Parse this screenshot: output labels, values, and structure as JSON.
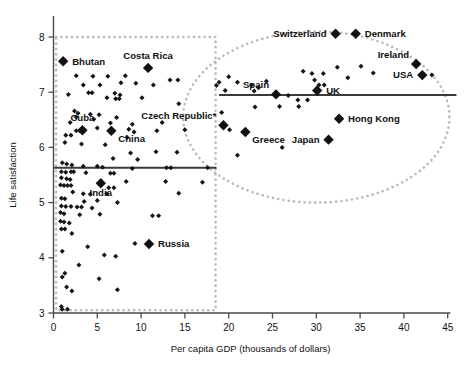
{
  "chart_data": {
    "type": "scatter",
    "title": "",
    "xlabel": "Per capita GDP (thousands of dollars)",
    "ylabel": "Life satisfaction",
    "xlim": [
      0,
      45
    ],
    "ylim": [
      3,
      8.2
    ],
    "xticks": [
      0,
      5,
      10,
      15,
      20,
      25,
      30,
      35,
      40,
      45
    ],
    "yticks": [
      3,
      4,
      5,
      6,
      7,
      8
    ],
    "grid": false,
    "legend": "none",
    "annotations": [
      {
        "text": "Czech Republic*",
        "note": "asterisk footnote marker on label"
      }
    ],
    "regions": [
      {
        "name": "poorer-countries-box",
        "shape": "rectangle",
        "style": "dotted",
        "x_range": [
          0.3,
          18.5
        ],
        "y_range": [
          3.05,
          8.0
        ]
      },
      {
        "name": "richer-countries-ellipse",
        "shape": "ellipse",
        "style": "dotted",
        "x_center": 30.0,
        "y_center": 6.55,
        "x_radius": 15.2,
        "y_radius": 1.55
      }
    ],
    "trend_lines": [
      {
        "name": "poorer-countries-trend",
        "y": 5.63,
        "x_start": 0.0,
        "x_end": 18.6
      },
      {
        "name": "richer-countries-trend",
        "y": 6.95,
        "x_start": 18.9,
        "x_end": 46.0
      }
    ],
    "labeled_points": [
      {
        "label": "Bhutan",
        "x": 1.1,
        "y": 7.56,
        "label_side": "right"
      },
      {
        "label": "Costa Rica",
        "x": 10.8,
        "y": 7.44,
        "label_side": "above"
      },
      {
        "label": "Cuba",
        "x": 3.3,
        "y": 6.31,
        "label_side": "above"
      },
      {
        "label": "China",
        "x": 6.6,
        "y": 6.3,
        "label_side": "below-right"
      },
      {
        "label": "India",
        "x": 5.4,
        "y": 5.35,
        "label_side": "below"
      },
      {
        "label": "Russia",
        "x": 10.9,
        "y": 4.25,
        "label_side": "right"
      },
      {
        "label": "Czech Republic*",
        "x": 19.4,
        "y": 6.4,
        "label_side": "above-left"
      },
      {
        "label": "Greece",
        "x": 21.9,
        "y": 6.28,
        "label_side": "below-right"
      },
      {
        "label": "Spain",
        "x": 25.4,
        "y": 6.96,
        "label_side": "above-left"
      },
      {
        "label": "Japan",
        "x": 31.4,
        "y": 6.14,
        "label_side": "left"
      },
      {
        "label": "Hong Kong",
        "x": 32.6,
        "y": 6.52,
        "label_side": "right"
      },
      {
        "label": "UK",
        "x": 30.1,
        "y": 7.03,
        "label_side": "right"
      },
      {
        "label": "Switzerland",
        "x": 32.2,
        "y": 8.06,
        "label_side": "left"
      },
      {
        "label": "Denmark",
        "x": 34.5,
        "y": 8.06,
        "label_side": "right"
      },
      {
        "label": "Ireland",
        "x": 41.4,
        "y": 7.51,
        "label_side": "above-left"
      },
      {
        "label": "USA",
        "x": 42.1,
        "y": 7.31,
        "label_side": "left"
      }
    ],
    "unlabeled_points": [
      {
        "x": 2.6,
        "y": 7.3
      },
      {
        "x": 4.5,
        "y": 7.29
      },
      {
        "x": 6.2,
        "y": 7.29
      },
      {
        "x": 8.2,
        "y": 7.3
      },
      {
        "x": 13.3,
        "y": 7.22
      },
      {
        "x": 14.2,
        "y": 7.22
      },
      {
        "x": 3.4,
        "y": 7.13
      },
      {
        "x": 5.3,
        "y": 7.13
      },
      {
        "x": 7.7,
        "y": 7.17
      },
      {
        "x": 9.4,
        "y": 7.16
      },
      {
        "x": 11.4,
        "y": 7.13
      },
      {
        "x": 1.7,
        "y": 6.96
      },
      {
        "x": 4.0,
        "y": 6.99
      },
      {
        "x": 4.4,
        "y": 6.99
      },
      {
        "x": 7.0,
        "y": 6.98
      },
      {
        "x": 7.6,
        "y": 6.95
      },
      {
        "x": 6.1,
        "y": 6.9
      },
      {
        "x": 7.1,
        "y": 6.88
      },
      {
        "x": 7.5,
        "y": 6.88
      },
      {
        "x": 10.1,
        "y": 6.9
      },
      {
        "x": 14.3,
        "y": 6.79
      },
      {
        "x": 2.4,
        "y": 6.66
      },
      {
        "x": 2.8,
        "y": 6.62
      },
      {
        "x": 4.2,
        "y": 6.6
      },
      {
        "x": 5.2,
        "y": 6.59
      },
      {
        "x": 2.6,
        "y": 6.55
      },
      {
        "x": 4.6,
        "y": 6.51
      },
      {
        "x": 7.2,
        "y": 6.54
      },
      {
        "x": 1.9,
        "y": 6.45
      },
      {
        "x": 6.5,
        "y": 6.44
      },
      {
        "x": 9.0,
        "y": 6.42
      },
      {
        "x": 12.4,
        "y": 6.45
      },
      {
        "x": 5.0,
        "y": 6.35
      },
      {
        "x": 8.6,
        "y": 6.33
      },
      {
        "x": 9.2,
        "y": 6.28
      },
      {
        "x": 11.8,
        "y": 6.3
      },
      {
        "x": 15.0,
        "y": 6.32
      },
      {
        "x": 1.4,
        "y": 6.22
      },
      {
        "x": 2.0,
        "y": 6.22
      },
      {
        "x": 2.6,
        "y": 6.3
      },
      {
        "x": 3.0,
        "y": 6.3
      },
      {
        "x": 8.4,
        "y": 6.18
      },
      {
        "x": 1.3,
        "y": 6.09
      },
      {
        "x": 3.2,
        "y": 6.06
      },
      {
        "x": 5.9,
        "y": 6.05
      },
      {
        "x": 8.8,
        "y": 5.9
      },
      {
        "x": 11.7,
        "y": 5.92
      },
      {
        "x": 14.1,
        "y": 5.91
      },
      {
        "x": 6.8,
        "y": 5.8
      },
      {
        "x": 9.6,
        "y": 5.78
      },
      {
        "x": 1.0,
        "y": 5.72
      },
      {
        "x": 1.5,
        "y": 5.7
      },
      {
        "x": 2.1,
        "y": 5.68
      },
      {
        "x": 3.4,
        "y": 5.66
      },
      {
        "x": 5.0,
        "y": 5.66
      },
      {
        "x": 5.6,
        "y": 5.64
      },
      {
        "x": 9.0,
        "y": 5.62
      },
      {
        "x": 12.9,
        "y": 5.63
      },
      {
        "x": 13.4,
        "y": 5.63
      },
      {
        "x": 17.6,
        "y": 5.63
      },
      {
        "x": 0.9,
        "y": 5.56
      },
      {
        "x": 1.4,
        "y": 5.55
      },
      {
        "x": 2.0,
        "y": 5.56
      },
      {
        "x": 2.3,
        "y": 5.56
      },
      {
        "x": 3.7,
        "y": 5.54
      },
      {
        "x": 6.5,
        "y": 5.53
      },
      {
        "x": 6.9,
        "y": 5.53
      },
      {
        "x": 0.9,
        "y": 5.45
      },
      {
        "x": 1.5,
        "y": 5.43
      },
      {
        "x": 1.9,
        "y": 5.42
      },
      {
        "x": 8.3,
        "y": 5.38
      },
      {
        "x": 12.8,
        "y": 5.38
      },
      {
        "x": 17.0,
        "y": 5.37
      },
      {
        "x": 0.8,
        "y": 5.32
      },
      {
        "x": 1.2,
        "y": 5.31
      },
      {
        "x": 1.6,
        "y": 5.31
      },
      {
        "x": 2.0,
        "y": 5.31
      },
      {
        "x": 6.3,
        "y": 5.27
      },
      {
        "x": 6.9,
        "y": 5.27
      },
      {
        "x": 2.2,
        "y": 5.19
      },
      {
        "x": 3.4,
        "y": 5.16
      },
      {
        "x": 4.2,
        "y": 5.15
      },
      {
        "x": 6.1,
        "y": 5.16
      },
      {
        "x": 14.3,
        "y": 5.17
      },
      {
        "x": 0.9,
        "y": 5.08
      },
      {
        "x": 1.3,
        "y": 5.07
      },
      {
        "x": 3.5,
        "y": 5.02
      },
      {
        "x": 5.0,
        "y": 5.04
      },
      {
        "x": 7.3,
        "y": 5.0
      },
      {
        "x": 0.9,
        "y": 4.94
      },
      {
        "x": 1.4,
        "y": 4.93
      },
      {
        "x": 2.0,
        "y": 4.93
      },
      {
        "x": 2.7,
        "y": 4.92
      },
      {
        "x": 3.2,
        "y": 4.92
      },
      {
        "x": 4.4,
        "y": 4.9
      },
      {
        "x": 0.8,
        "y": 4.82
      },
      {
        "x": 1.2,
        "y": 4.8
      },
      {
        "x": 3.0,
        "y": 4.78
      },
      {
        "x": 5.3,
        "y": 4.79
      },
      {
        "x": 11.3,
        "y": 4.76
      },
      {
        "x": 12.0,
        "y": 4.76
      },
      {
        "x": 0.8,
        "y": 4.66
      },
      {
        "x": 1.2,
        "y": 4.65
      },
      {
        "x": 1.8,
        "y": 4.63
      },
      {
        "x": 0.9,
        "y": 4.52
      },
      {
        "x": 1.3,
        "y": 4.52
      },
      {
        "x": 2.1,
        "y": 4.44
      },
      {
        "x": 9.3,
        "y": 4.26
      },
      {
        "x": 3.9,
        "y": 4.2
      },
      {
        "x": 1.0,
        "y": 4.12
      },
      {
        "x": 5.8,
        "y": 4.05
      },
      {
        "x": 7.1,
        "y": 4.03
      },
      {
        "x": 2.9,
        "y": 3.87
      },
      {
        "x": 1.3,
        "y": 3.72
      },
      {
        "x": 1.0,
        "y": 3.65
      },
      {
        "x": 5.2,
        "y": 3.62
      },
      {
        "x": 1.5,
        "y": 3.47
      },
      {
        "x": 2.1,
        "y": 3.4
      },
      {
        "x": 7.3,
        "y": 3.42
      },
      {
        "x": 0.9,
        "y": 3.12
      },
      {
        "x": 1.0,
        "y": 3.07
      },
      {
        "x": 1.6,
        "y": 3.07
      },
      {
        "x": 18.9,
        "y": 7.18
      },
      {
        "x": 20.0,
        "y": 7.28
      },
      {
        "x": 21.0,
        "y": 7.18
      },
      {
        "x": 22.6,
        "y": 7.13
      },
      {
        "x": 24.3,
        "y": 7.2
      },
      {
        "x": 28.5,
        "y": 7.38
      },
      {
        "x": 29.5,
        "y": 7.34
      },
      {
        "x": 30.8,
        "y": 7.34
      },
      {
        "x": 32.4,
        "y": 7.45
      },
      {
        "x": 35.1,
        "y": 7.47
      },
      {
        "x": 36.5,
        "y": 7.35
      },
      {
        "x": 29.8,
        "y": 7.22
      },
      {
        "x": 33.6,
        "y": 7.26
      },
      {
        "x": 18.6,
        "y": 7.12
      },
      {
        "x": 23.4,
        "y": 7.08
      },
      {
        "x": 30.3,
        "y": 7.13
      },
      {
        "x": 30.9,
        "y": 7.13
      },
      {
        "x": 43.2,
        "y": 7.31
      },
      {
        "x": 19.6,
        "y": 7.03
      },
      {
        "x": 22.9,
        "y": 7.02
      },
      {
        "x": 26.8,
        "y": 6.94
      },
      {
        "x": 27.9,
        "y": 6.86
      },
      {
        "x": 29.0,
        "y": 6.86
      },
      {
        "x": 23.0,
        "y": 6.73
      },
      {
        "x": 25.8,
        "y": 6.74
      },
      {
        "x": 28.0,
        "y": 6.74
      },
      {
        "x": 19.2,
        "y": 6.63
      },
      {
        "x": 20.1,
        "y": 6.32
      },
      {
        "x": 26.1,
        "y": 6.0
      },
      {
        "x": 21.0,
        "y": 5.86
      }
    ]
  }
}
